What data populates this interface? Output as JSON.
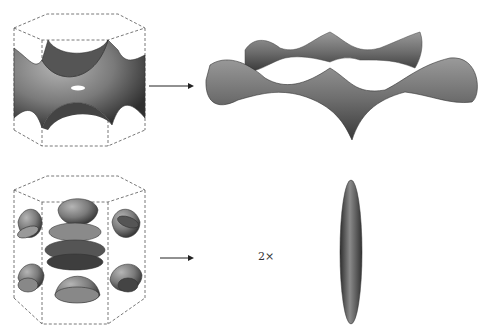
{
  "panels": [
    {
      "id": "top",
      "left_figure": "hexagonal-prism-with-connected-sheet-surface",
      "right_figure": "corrugated-ring-surface",
      "arrow": "right-arrow",
      "multiplier": ""
    },
    {
      "id": "bottom",
      "left_figure": "hexagonal-prism-with-lens-pockets",
      "right_figure": "ellipsoid-cigar",
      "arrow": "right-arrow",
      "multiplier": "2×"
    }
  ],
  "colors": {
    "surface_dark": "#3a3a3a",
    "surface_mid": "#7a7a7a",
    "surface_light": "#b5b5b5",
    "outline": "#555555"
  }
}
